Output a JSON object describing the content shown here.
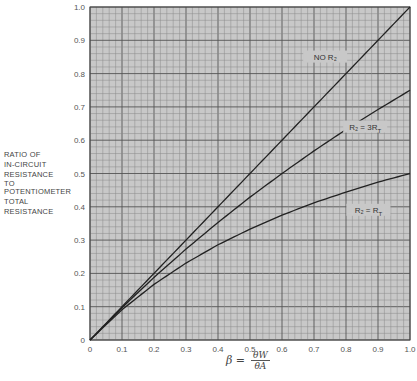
{
  "chart_data": {
    "type": "line",
    "title": "",
    "xlabel": "β = θW / θA",
    "xlabel_parts": {
      "lhs": "β =",
      "numerator": "θW",
      "denominator": "θA"
    },
    "ylabel_lines": [
      "RATIO OF",
      "IN-CIRCUIT",
      "RESISTANCE",
      "TO",
      "POTENTIOMETER",
      "TOTAL",
      "RESISTANCE"
    ],
    "xlim": [
      0,
      1.0
    ],
    "ylim": [
      0,
      1.0
    ],
    "grid": true,
    "x_ticks": [
      "0",
      "0.1",
      "0.2",
      "0.3",
      "0.4",
      "0.5",
      "0.6",
      "0.7",
      "0.8",
      "0.9",
      "1.0"
    ],
    "y_ticks": [
      "0",
      "0.1",
      "0.2",
      "0.3",
      "0.4",
      "0.5",
      "0.6",
      "0.7",
      "0.8",
      "0.9",
      "1.0"
    ],
    "x": [
      0,
      0.1,
      0.2,
      0.3,
      0.4,
      0.5,
      0.6,
      0.7,
      0.8,
      0.9,
      1.0
    ],
    "series": [
      {
        "name": "NO R2",
        "label": "NO R₂",
        "values": [
          0,
          0.1,
          0.2,
          0.3,
          0.4,
          0.5,
          0.6,
          0.7,
          0.8,
          0.9,
          1.0
        ],
        "label_pos": [
          0.735,
          0.845
        ]
      },
      {
        "name": "R2 = 3RT",
        "label": "R₂ = 3R_T",
        "values": [
          0,
          0.097,
          0.188,
          0.273,
          0.353,
          0.429,
          0.5,
          0.568,
          0.632,
          0.692,
          0.75
        ],
        "label_pos": [
          0.86,
          0.635
        ]
      },
      {
        "name": "R2 = RT",
        "label": "R₂ = R_T",
        "values": [
          0,
          0.091,
          0.167,
          0.231,
          0.286,
          0.333,
          0.375,
          0.412,
          0.444,
          0.474,
          0.5
        ],
        "label_pos": [
          0.87,
          0.385
        ]
      }
    ],
    "colors": {
      "grid_bg": "#c8c8c8",
      "minor_grid": "#8a8a8a",
      "major_grid": "#555555",
      "curve": "#222222"
    }
  }
}
